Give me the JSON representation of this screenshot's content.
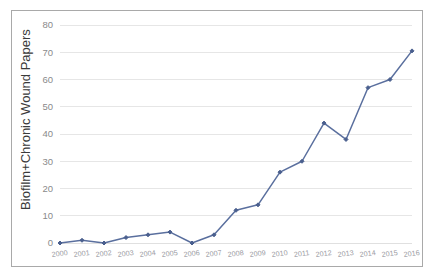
{
  "chart_data": {
    "type": "line",
    "title": "",
    "subtitle": "",
    "xlabel": "",
    "ylabel": "Biofilm+Chronic Wound Papers",
    "categories": [
      "2000",
      "2001",
      "2002",
      "2003",
      "2004",
      "2005",
      "2006",
      "2007",
      "2008",
      "2009",
      "2010",
      "2011",
      "2012",
      "2013",
      "2014",
      "2015",
      "2016"
    ],
    "values": [
      0,
      1,
      0,
      2,
      3,
      4,
      0,
      3,
      12,
      14,
      26,
      30,
      44,
      38,
      57,
      60,
      70.5
    ],
    "series": [
      {
        "name": "Biofilm+Chronic Wound Papers",
        "values": [
          0,
          1,
          0,
          2,
          3,
          4,
          0,
          3,
          12,
          14,
          26,
          30,
          44,
          38,
          57,
          60,
          70.5
        ]
      }
    ],
    "ylim": [
      0,
      80
    ],
    "yticks": [
      0,
      10,
      20,
      30,
      40,
      50,
      60,
      70,
      80
    ],
    "ytick_labels": [
      "0",
      "10",
      "20",
      "30",
      "40",
      "50",
      "60",
      "70",
      "80"
    ],
    "xtick_labels": [
      "2000",
      "2001",
      "2002",
      "2003",
      "2004",
      "2005",
      "2006",
      "2007",
      "2008",
      "2009",
      "2010",
      "2011",
      "2012",
      "2013",
      "2014",
      "2015",
      "2016"
    ],
    "grid": true,
    "grid_axis": "y",
    "legend": false,
    "legend_position": "none",
    "markers": true,
    "marker_shape": "diamond",
    "line_color": "#5a6f9e",
    "marker_color": "#4a5f8e",
    "grid_color": "#e6e6e6",
    "axis_text_color": "#8a8a8a",
    "xtick_text_color": "#9a9aa2",
    "label_color": "#3a3a3a",
    "background_color": "#ffffff",
    "border_color": "#a9a9a9",
    "xtick_rotation": -8
  }
}
